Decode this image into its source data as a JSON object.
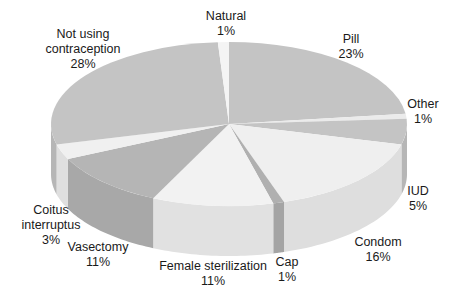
{
  "chart_data": {
    "type": "pie",
    "style": "3d-exploded-none",
    "title": "",
    "start_angle": "12 o'clock",
    "direction": "clockwise",
    "slices": [
      {
        "label": "Pill",
        "value": 23,
        "display": "23%",
        "color": "#c4c4c4"
      },
      {
        "label": "Other",
        "value": 1,
        "display": "1%",
        "color": "#ebebeb"
      },
      {
        "label": "IUD",
        "value": 5,
        "display": "5%",
        "color": "#c4c4c4"
      },
      {
        "label": "Condom",
        "value": 16,
        "display": "16%",
        "color": "#efefef"
      },
      {
        "label": "Cap",
        "value": 1,
        "display": "1%",
        "color": "#b0b0b0"
      },
      {
        "label": "Female sterilization",
        "value": 11,
        "display": "11%",
        "color": "#f2f2f2"
      },
      {
        "label": "Vasectomy",
        "value": 11,
        "display": "11%",
        "color": "#b5b5b5"
      },
      {
        "label": "Coitus interruptus",
        "value": 3,
        "display": "3%",
        "color": "#f0f0f0"
      },
      {
        "label": "Not using contraception",
        "value": 28,
        "display": "28%",
        "color": "#c4c4c4"
      },
      {
        "label": "Natural",
        "value": 1,
        "display": "1%",
        "color": "#f4f4f4"
      }
    ]
  },
  "labels": [
    {
      "key": "natural",
      "lines": [
        "Natural",
        "1%"
      ],
      "x": 226,
      "y": 9
    },
    {
      "key": "not-using",
      "lines": [
        "Not using",
        "contraception",
        "28%"
      ],
      "x": 83,
      "y": 27
    },
    {
      "key": "pill",
      "lines": [
        "Pill",
        "23%"
      ],
      "x": 351,
      "y": 32
    },
    {
      "key": "other",
      "lines": [
        "Other",
        "1%"
      ],
      "x": 423,
      "y": 97
    },
    {
      "key": "iud",
      "lines": [
        "IUD",
        "5%"
      ],
      "x": 418,
      "y": 184
    },
    {
      "key": "condom",
      "lines": [
        "Condom",
        "16%"
      ],
      "x": 378,
      "y": 235
    },
    {
      "key": "cap",
      "lines": [
        "Cap",
        "1%"
      ],
      "x": 287,
      "y": 255
    },
    {
      "key": "female-sterilization",
      "lines": [
        "Female sterilization",
        "11%"
      ],
      "x": 213,
      "y": 259
    },
    {
      "key": "vasectomy",
      "lines": [
        "Vasectomy",
        "11%"
      ],
      "x": 98,
      "y": 240
    },
    {
      "key": "coitus",
      "lines": [
        "Coitus",
        "interruptus",
        "3%"
      ],
      "x": 51,
      "y": 203
    }
  ]
}
